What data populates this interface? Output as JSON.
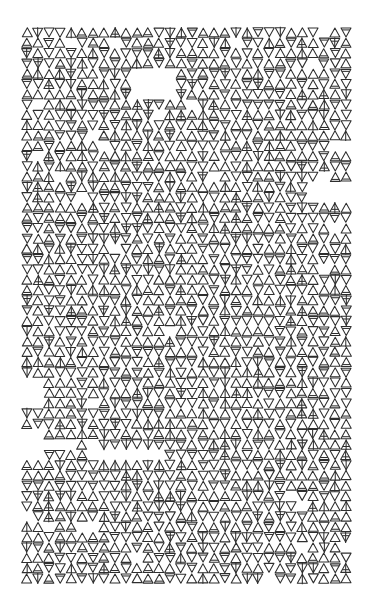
{
  "artwork": {
    "description": "Plotter-style generative pattern of alternating outlined triangles",
    "background": "#ffffff",
    "stroke": "#2e2e2e",
    "grid": {
      "origin_x": 22,
      "origin_y": 28,
      "columns": 30,
      "rows": 54,
      "cell_width": 11,
      "cell_height": 10.3,
      "triangle_width": 10,
      "triangle_height": 9
    },
    "glyph_variants": [
      "up-plain",
      "down-plain",
      "up-bar",
      "down-bar",
      "up-spine",
      "down-spine"
    ],
    "seed": 7,
    "gaps": [
      {
        "col_start": 10,
        "col_end": 14,
        "row_start": 4,
        "row_end": 7
      },
      {
        "col_start": 26,
        "col_end": 30,
        "row_start": 15,
        "row_end": 17
      },
      {
        "col_start": 0,
        "col_end": 2,
        "row_start": 39,
        "row_end": 42
      },
      {
        "col_start": 2,
        "col_end": 5,
        "row_start": 40,
        "row_end": 41
      },
      {
        "col_start": 6,
        "col_end": 13,
        "row_start": 41,
        "row_end": 42
      },
      {
        "col_start": 0,
        "col_end": 2,
        "row_start": 34,
        "row_end": 37
      },
      {
        "col_start": 28,
        "col_end": 30,
        "row_start": 11,
        "row_end": 12
      },
      {
        "col_start": 5,
        "col_end": 7,
        "row_start": 48,
        "row_end": 49
      }
    ]
  }
}
